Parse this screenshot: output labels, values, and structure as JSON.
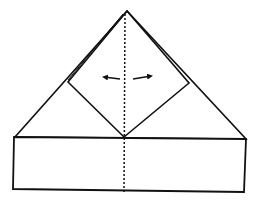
{
  "diagram": {
    "type": "origami-fold-step",
    "colors": {
      "stroke": "#111111",
      "background": "#ffffff"
    },
    "shapes": {
      "triangle": {
        "apex": [
          127,
          11
        ],
        "left": [
          15,
          137
        ],
        "right": [
          246,
          139
        ]
      },
      "band": {
        "tl": [
          14,
          137
        ],
        "tr": [
          246,
          139
        ],
        "br": [
          244,
          192
        ],
        "bl": [
          13,
          189
        ]
      },
      "diamond": {
        "top": [
          127,
          11
        ],
        "left": [
          68,
          82
        ],
        "bottom": [
          124,
          137
        ],
        "right": [
          189,
          83
        ]
      },
      "fold_line": {
        "x1": 125,
        "y1": 14,
        "x2": 124,
        "y2": 192
      },
      "arrows": [
        {
          "direction": "left",
          "from": [
            120,
            79
          ],
          "to": [
            103,
            77
          ]
        },
        {
          "direction": "right",
          "from": [
            133,
            79
          ],
          "to": [
            152,
            76
          ]
        }
      ]
    }
  }
}
